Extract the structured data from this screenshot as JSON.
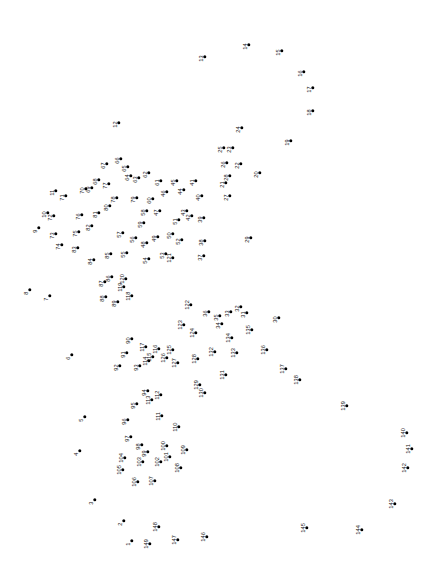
{
  "puzzle": {
    "kind": "connect-the-dots",
    "canvas": {
      "width": 430,
      "height": 572,
      "background": "#ffffff"
    },
    "dot_color": "#000000",
    "label_color": "#111111",
    "label_rotation_deg": -90,
    "total_points": 149,
    "points": [
      {
        "n": 1,
        "x": 132,
        "y": 541
      },
      {
        "n": 2,
        "x": 124,
        "y": 521
      },
      {
        "n": 3,
        "x": 95,
        "y": 500
      },
      {
        "n": 4,
        "x": 80,
        "y": 451
      },
      {
        "n": 5,
        "x": 85,
        "y": 417
      },
      {
        "n": 6,
        "x": 72,
        "y": 355
      },
      {
        "n": 7,
        "x": 50,
        "y": 296
      },
      {
        "n": 8,
        "x": 30,
        "y": 290
      },
      {
        "n": 9,
        "x": 39,
        "y": 228
      },
      {
        "n": 10,
        "x": 48,
        "y": 213
      },
      {
        "n": 11,
        "x": 56,
        "y": 191
      },
      {
        "n": 12,
        "x": 119,
        "y": 123
      },
      {
        "n": 13,
        "x": 205,
        "y": 57
      },
      {
        "n": 14,
        "x": 249,
        "y": 45
      },
      {
        "n": 15,
        "x": 282,
        "y": 51
      },
      {
        "n": 16,
        "x": 304,
        "y": 72
      },
      {
        "n": 17,
        "x": 313,
        "y": 88
      },
      {
        "n": 18,
        "x": 313,
        "y": 111
      },
      {
        "n": 19,
        "x": 291,
        "y": 141
      },
      {
        "n": 20,
        "x": 260,
        "y": 173
      },
      {
        "n": 21,
        "x": 226,
        "y": 183
      },
      {
        "n": 22,
        "x": 241,
        "y": 164
      },
      {
        "n": 23,
        "x": 233,
        "y": 148
      },
      {
        "n": 24,
        "x": 242,
        "y": 128
      },
      {
        "n": 25,
        "x": 224,
        "y": 148
      },
      {
        "n": 26,
        "x": 227,
        "y": 163
      },
      {
        "n": 27,
        "x": 230,
        "y": 196
      },
      {
        "n": 28,
        "x": 230,
        "y": 176
      },
      {
        "n": 29,
        "x": 251,
        "y": 238
      },
      {
        "n": 30,
        "x": 279,
        "y": 318
      },
      {
        "n": 31,
        "x": 247,
        "y": 313
      },
      {
        "n": 32,
        "x": 241,
        "y": 307
      },
      {
        "n": 33,
        "x": 231,
        "y": 312
      },
      {
        "n": 34,
        "x": 222,
        "y": 324
      },
      {
        "n": 35,
        "x": 220,
        "y": 316
      },
      {
        "n": 36,
        "x": 209,
        "y": 312
      },
      {
        "n": 37,
        "x": 204,
        "y": 256
      },
      {
        "n": 38,
        "x": 205,
        "y": 241
      },
      {
        "n": 39,
        "x": 204,
        "y": 218
      },
      {
        "n": 40,
        "x": 202,
        "y": 196
      },
      {
        "n": 41,
        "x": 196,
        "y": 181
      },
      {
        "n": 42,
        "x": 192,
        "y": 216
      },
      {
        "n": 43,
        "x": 187,
        "y": 211
      },
      {
        "n": 44,
        "x": 184,
        "y": 190
      },
      {
        "n": 45,
        "x": 177,
        "y": 181
      },
      {
        "n": 46,
        "x": 167,
        "y": 192
      },
      {
        "n": 47,
        "x": 160,
        "y": 211
      },
      {
        "n": 48,
        "x": 147,
        "y": 243
      },
      {
        "n": 49,
        "x": 158,
        "y": 237
      },
      {
        "n": 50,
        "x": 173,
        "y": 234
      },
      {
        "n": 51,
        "x": 179,
        "y": 220
      },
      {
        "n": 52,
        "x": 182,
        "y": 240
      },
      {
        "n": 53,
        "x": 166,
        "y": 254
      },
      {
        "n": 54,
        "x": 149,
        "y": 259
      },
      {
        "n": 55,
        "x": 127,
        "y": 253
      },
      {
        "n": 56,
        "x": 136,
        "y": 238
      },
      {
        "n": 57,
        "x": 123,
        "y": 233
      },
      {
        "n": 58,
        "x": 147,
        "y": 211
      },
      {
        "n": 59,
        "x": 144,
        "y": 223
      },
      {
        "n": 60,
        "x": 153,
        "y": 199
      },
      {
        "n": 61,
        "x": 161,
        "y": 181
      },
      {
        "n": 62,
        "x": 149,
        "y": 173
      },
      {
        "n": 63,
        "x": 139,
        "y": 178
      },
      {
        "n": 64,
        "x": 131,
        "y": 176
      },
      {
        "n": 65,
        "x": 128,
        "y": 167
      },
      {
        "n": 66,
        "x": 121,
        "y": 159
      },
      {
        "n": 67,
        "x": 107,
        "y": 164
      },
      {
        "n": 68,
        "x": 99,
        "y": 180
      },
      {
        "n": 69,
        "x": 92,
        "y": 188
      },
      {
        "n": 70,
        "x": 86,
        "y": 189
      },
      {
        "n": 71,
        "x": 66,
        "y": 196
      },
      {
        "n": 72,
        "x": 54,
        "y": 216
      },
      {
        "n": 73,
        "x": 56,
        "y": 234
      },
      {
        "n": 74,
        "x": 62,
        "y": 245
      },
      {
        "n": 75,
        "x": 79,
        "y": 232
      },
      {
        "n": 76,
        "x": 82,
        "y": 215
      },
      {
        "n": 77,
        "x": 109,
        "y": 184
      },
      {
        "n": 78,
        "x": 117,
        "y": 198
      },
      {
        "n": 79,
        "x": 137,
        "y": 198
      },
      {
        "n": 80,
        "x": 110,
        "y": 206
      },
      {
        "n": 81,
        "x": 99,
        "y": 213
      },
      {
        "n": 82,
        "x": 92,
        "y": 226
      },
      {
        "n": 83,
        "x": 78,
        "y": 248
      },
      {
        "n": 84,
        "x": 94,
        "y": 260
      },
      {
        "n": 85,
        "x": 111,
        "y": 254
      },
      {
        "n": 86,
        "x": 112,
        "y": 277
      },
      {
        "n": 87,
        "x": 105,
        "y": 282
      },
      {
        "n": 88,
        "x": 106,
        "y": 297
      },
      {
        "n": 89,
        "x": 118,
        "y": 302
      },
      {
        "n": 90,
        "x": 132,
        "y": 339
      },
      {
        "n": 91,
        "x": 127,
        "y": 353
      },
      {
        "n": 92,
        "x": 120,
        "y": 366
      },
      {
        "n": 93,
        "x": 140,
        "y": 366
      },
      {
        "n": 94,
        "x": 148,
        "y": 391
      },
      {
        "n": 95,
        "x": 137,
        "y": 404
      },
      {
        "n": 96,
        "x": 128,
        "y": 420
      },
      {
        "n": 97,
        "x": 131,
        "y": 437
      },
      {
        "n": 98,
        "x": 142,
        "y": 445
      },
      {
        "n": 99,
        "x": 148,
        "y": 452
      },
      {
        "n": 100,
        "x": 167,
        "y": 446
      },
      {
        "n": 101,
        "x": 170,
        "y": 457
      },
      {
        "n": 102,
        "x": 161,
        "y": 462
      },
      {
        "n": 103,
        "x": 143,
        "y": 462
      },
      {
        "n": 104,
        "x": 125,
        "y": 458
      },
      {
        "n": 105,
        "x": 123,
        "y": 470
      },
      {
        "n": 106,
        "x": 138,
        "y": 482
      },
      {
        "n": 107,
        "x": 155,
        "y": 481
      },
      {
        "n": 108,
        "x": 181,
        "y": 468
      },
      {
        "n": 109,
        "x": 187,
        "y": 450
      },
      {
        "n": 110,
        "x": 179,
        "y": 427
      },
      {
        "n": 111,
        "x": 162,
        "y": 416
      },
      {
        "n": 112,
        "x": 161,
        "y": 395
      },
      {
        "n": 113,
        "x": 152,
        "y": 400
      },
      {
        "n": 114,
        "x": 149,
        "y": 361
      },
      {
        "n": 115,
        "x": 153,
        "y": 357
      },
      {
        "n": 116,
        "x": 159,
        "y": 349
      },
      {
        "n": 117,
        "x": 146,
        "y": 347
      },
      {
        "n": 118,
        "x": 132,
        "y": 296
      },
      {
        "n": 119,
        "x": 124,
        "y": 287
      },
      {
        "n": 120,
        "x": 126,
        "y": 279
      },
      {
        "n": 121,
        "x": 173,
        "y": 258
      },
      {
        "n": 122,
        "x": 191,
        "y": 305
      },
      {
        "n": 123,
        "x": 184,
        "y": 325
      },
      {
        "n": 124,
        "x": 196,
        "y": 333
      },
      {
        "n": 125,
        "x": 173,
        "y": 350
      },
      {
        "n": 126,
        "x": 167,
        "y": 358
      },
      {
        "n": 127,
        "x": 178,
        "y": 363
      },
      {
        "n": 128,
        "x": 198,
        "y": 359
      },
      {
        "n": 129,
        "x": 200,
        "y": 385
      },
      {
        "n": 130,
        "x": 205,
        "y": 393
      },
      {
        "n": 131,
        "x": 226,
        "y": 375
      },
      {
        "n": 132,
        "x": 215,
        "y": 352
      },
      {
        "n": 133,
        "x": 237,
        "y": 353
      },
      {
        "n": 134,
        "x": 232,
        "y": 338
      },
      {
        "n": 135,
        "x": 252,
        "y": 330
      },
      {
        "n": 136,
        "x": 267,
        "y": 350
      },
      {
        "n": 137,
        "x": 286,
        "y": 369
      },
      {
        "n": 138,
        "x": 300,
        "y": 380
      },
      {
        "n": 139,
        "x": 347,
        "y": 406
      },
      {
        "n": 140,
        "x": 407,
        "y": 433
      },
      {
        "n": 141,
        "x": 412,
        "y": 449
      },
      {
        "n": 142,
        "x": 408,
        "y": 468
      },
      {
        "n": 143,
        "x": 395,
        "y": 504
      },
      {
        "n": 144,
        "x": 362,
        "y": 530
      },
      {
        "n": 145,
        "x": 307,
        "y": 528
      },
      {
        "n": 146,
        "x": 207,
        "y": 537
      },
      {
        "n": 147,
        "x": 178,
        "y": 540
      },
      {
        "n": 148,
        "x": 159,
        "y": 527
      },
      {
        "n": 149,
        "x": 150,
        "y": 544
      }
    ]
  }
}
